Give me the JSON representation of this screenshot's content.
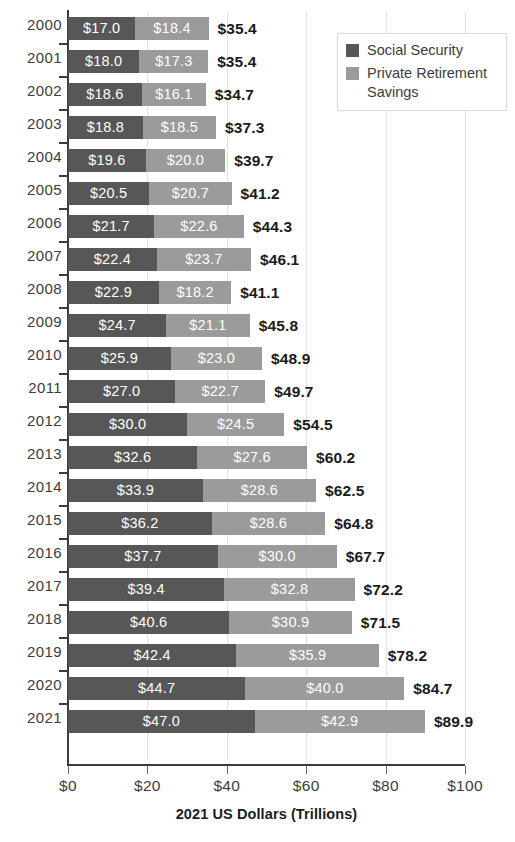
{
  "chart_data": {
    "type": "bar",
    "orientation": "horizontal",
    "stacked": true,
    "title": "",
    "xlabel": "2021 US Dollars (Trillions)",
    "ylabel": "",
    "xlim": [
      0,
      100
    ],
    "xticks": [
      0,
      20,
      40,
      60,
      80,
      100
    ],
    "xtick_labels": [
      "$0",
      "$20",
      "$40",
      "$60",
      "$80",
      "$100"
    ],
    "grid": true,
    "grid_axis": "x",
    "legend_position": "top-right",
    "categories": [
      "2000",
      "2001",
      "2002",
      "2003",
      "2004",
      "2005",
      "2006",
      "2007",
      "2008",
      "2009",
      "2010",
      "2011",
      "2012",
      "2013",
      "2014",
      "2015",
      "2016",
      "2017",
      "2018",
      "2019",
      "2020",
      "2021"
    ],
    "series": [
      {
        "name": "Social Security",
        "color": "#575757",
        "values": [
          17.0,
          18.0,
          18.6,
          18.8,
          19.6,
          20.5,
          21.7,
          22.4,
          22.9,
          24.7,
          25.9,
          27.0,
          30.0,
          32.6,
          33.9,
          36.2,
          37.7,
          39.4,
          40.6,
          42.4,
          44.7,
          47.0
        ],
        "labels": [
          "$17.0",
          "$18.0",
          "$18.6",
          "$18.8",
          "$19.6",
          "$20.5",
          "$21.7",
          "$22.4",
          "$22.9",
          "$24.7",
          "$25.9",
          "$27.0",
          "$30.0",
          "$32.6",
          "$33.9",
          "$36.2",
          "$37.7",
          "$39.4",
          "$40.6",
          "$42.4",
          "$44.7",
          "$47.0"
        ]
      },
      {
        "name": "Private Retirement Savings",
        "color": "#9b9b9b",
        "values": [
          18.4,
          17.3,
          16.1,
          18.5,
          20.0,
          20.7,
          22.6,
          23.7,
          18.2,
          21.1,
          23.0,
          22.7,
          24.5,
          27.6,
          28.6,
          28.6,
          30.0,
          32.8,
          30.9,
          35.9,
          40.0,
          42.9
        ],
        "labels": [
          "$18.4",
          "$17.3",
          "$16.1",
          "$18.5",
          "$20.0",
          "$20.7",
          "$22.6",
          "$23.7",
          "$18.2",
          "$21.1",
          "$23.0",
          "$22.7",
          "$24.5",
          "$27.6",
          "$28.6",
          "$28.6",
          "$30.0",
          "$32.8",
          "$30.9",
          "$35.9",
          "$40.0",
          "$42.9"
        ]
      }
    ],
    "totals": [
      35.4,
      35.4,
      34.7,
      37.3,
      39.7,
      41.2,
      44.3,
      46.1,
      41.1,
      45.8,
      48.9,
      49.7,
      54.5,
      60.2,
      62.5,
      64.8,
      67.7,
      72.2,
      71.5,
      78.2,
      84.7,
      89.9
    ],
    "total_labels": [
      "$35.4",
      "$35.4",
      "$34.7",
      "$37.3",
      "$39.7",
      "$41.2",
      "$44.3",
      "$46.1",
      "$41.1",
      "$45.8",
      "$48.9",
      "$49.7",
      "$54.5",
      "$60.2",
      "$62.5",
      "$64.8",
      "$67.7",
      "$72.2",
      "$71.5",
      "$78.2",
      "$84.7",
      "$89.9"
    ]
  },
  "legend": {
    "items": [
      {
        "label": "Social Security",
        "color": "#575757"
      },
      {
        "label": "Private Retirement Savings",
        "color": "#9b9b9b"
      }
    ]
  },
  "axis": {
    "x_title": "2021 US Dollars (Trillions)"
  },
  "colors": {
    "social_security": "#575757",
    "private_retirement": "#9b9b9b",
    "text": "#3c3c3c",
    "total_text": "#1b1b1b",
    "grid": "#e3e3e3",
    "axis": "#3c3c3c"
  }
}
